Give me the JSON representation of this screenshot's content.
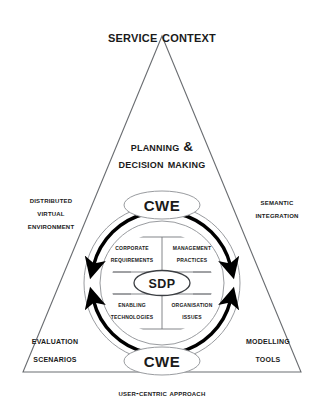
{
  "figure": {
    "title": "Service Context",
    "shape": "triangle-with-central-cycle",
    "background_color": "#ffffff",
    "line_color": "#55585c",
    "text_color": "#1a1a1a",
    "arrow_color": "#000000"
  },
  "triangle": {
    "apex_label": "Service Context",
    "upper_middle_label_line1": "Planning &",
    "upper_middle_label_line2": "Decision Making",
    "left_side_label_line1": "Distributed",
    "left_side_label_line2": "Virtual",
    "left_side_label_line3": "Environment",
    "right_side_label_line1": "Semantic",
    "right_side_label_line2": "Integration",
    "bottom_left_label_line1": "Evaluation",
    "bottom_left_label_line2": "Scenarios",
    "bottom_right_label_line1": "Modelling",
    "bottom_right_label_line2": "Tools",
    "base_caption": "User-Centric Approach"
  },
  "cycle": {
    "top_label": "CWE",
    "bottom_label": "CWE",
    "center_label": "SDP",
    "arrow_count": 4,
    "arrow_directions": [
      "down-left",
      "down-right",
      "up-left",
      "up-right"
    ]
  },
  "quadrants": [
    {
      "id": "corporate-requirements",
      "line1": "Corporate",
      "line2": "Requirements"
    },
    {
      "id": "management-practices",
      "line1": "Management",
      "line2": "Practices"
    },
    {
      "id": "enabling-technologies",
      "line1": "Enabling",
      "line2": "Technologies"
    },
    {
      "id": "organisation-issues",
      "line1": "Organisation",
      "line2": "Issues"
    }
  ]
}
